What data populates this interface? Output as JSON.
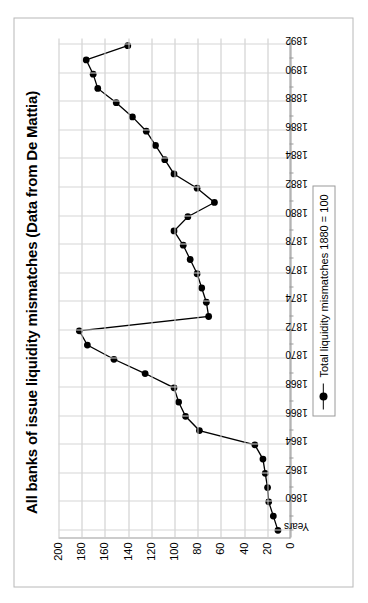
{
  "chart_data": {
    "type": "line",
    "title": "All banks of issue liquidity mismatches  (Data from De Mattia)",
    "xlabel": "",
    "ylabel": "",
    "ylim": [
      0,
      200
    ],
    "yticks": [
      0,
      20,
      40,
      60,
      80,
      100,
      120,
      140,
      160,
      180,
      200
    ],
    "grid": "both",
    "legend_position": "inside-left",
    "legend": [
      "Total liquidity mismatches 1880 = 100"
    ],
    "series": [
      {
        "name": "Total liquidity mismatches 1880 = 100",
        "color": "#000000",
        "marker": "filled-circle",
        "values": [
          10,
          14,
          18,
          19,
          21,
          23,
          30,
          78,
          90,
          96,
          100,
          125,
          152,
          175,
          182,
          70,
          72,
          76,
          80,
          86,
          92,
          100,
          88,
          65,
          80,
          100,
          108,
          116,
          124,
          136,
          150,
          166,
          170,
          176,
          140
        ]
      }
    ],
    "categories": [
      "Years",
      "",
      "1860",
      "",
      "1862",
      "",
      "1864",
      "",
      "1866",
      "",
      "1868",
      "",
      "1870",
      "",
      "1872",
      "",
      "1874",
      "",
      "1876",
      "",
      "1878",
      "",
      "1880",
      "",
      "1882",
      "",
      "1884",
      "",
      "1886",
      "",
      "1888",
      "",
      "1890",
      "",
      "1892"
    ],
    "tick_labels": [
      "Years",
      "1860",
      "1862",
      "1864",
      "1866",
      "1868",
      "1870",
      "1872",
      "1874",
      "1876",
      "1878",
      "1880",
      "1882",
      "1884",
      "1886",
      "1888",
      "1890",
      "1892"
    ]
  },
  "legend": {
    "entry_label": "Total liquidity mismatches 1880 = 100"
  }
}
